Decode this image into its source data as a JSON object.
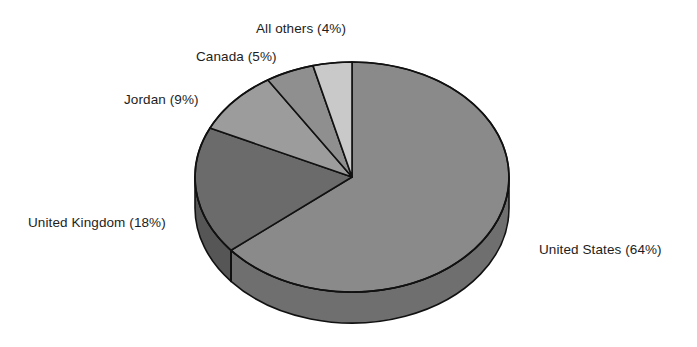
{
  "chart_data": {
    "type": "pie",
    "title": "",
    "subtitle": "",
    "xlabel": "",
    "ylabel": "",
    "legend_position": "none",
    "grid": false,
    "three_d": true,
    "start_angle_clock": "12 o'clock",
    "direction": "clockwise",
    "categories": [
      "United States",
      "United Kingdom",
      "Jordan",
      "Canada",
      "All others"
    ],
    "values": [
      64,
      18,
      9,
      5,
      4
    ],
    "value_unit": "%",
    "labels": [
      "United States (64%)",
      "United Kingdom (18%)",
      "Jordan (9%)",
      "Canada (5%)",
      "All others (4%)"
    ],
    "slices": [
      {
        "name": "United States",
        "value": 64,
        "label": "United States (64%)",
        "color": "#8a8a8a",
        "side_color": "#6f6f6f"
      },
      {
        "name": "United Kingdom",
        "value": 18,
        "label": "United Kingdom (18%)",
        "color": "#6b6b6b",
        "side_color": "#565656"
      },
      {
        "name": "Jordan",
        "value": 9,
        "label": "Jordan (9%)",
        "color": "#9c9c9c",
        "side_color": "#7d7d7d"
      },
      {
        "name": "Canada",
        "value": 5,
        "label": "Canada (5%)",
        "color": "#8f8f8f",
        "side_color": "#747474"
      },
      {
        "name": "All others",
        "value": 4,
        "label": "All others (4%)",
        "color": "#c9c9c9",
        "side_color": "#a3a3a3"
      }
    ],
    "outline_color": "#111111",
    "background_color": "#ffffff",
    "text_color": "#1d1d1d"
  }
}
